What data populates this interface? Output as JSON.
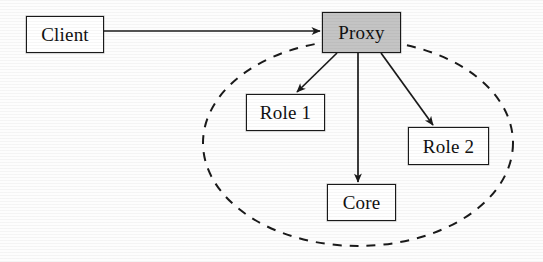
{
  "figure": {
    "type": "diagram",
    "subtype": "proxy-pattern-structure",
    "background_color": "#fdfdfd",
    "stroke_color": "#1a1a1a",
    "shaded_fill_color": "#c4c4c4"
  },
  "nodes": [
    {
      "id": "client",
      "label": "Client",
      "x": 26,
      "y": 16,
      "w": 78,
      "h": 37,
      "fill": "#ffffff",
      "shaded": false,
      "font_size": 19
    },
    {
      "id": "proxy",
      "label": "Proxy",
      "x": 322,
      "y": 12,
      "w": 79,
      "h": 41,
      "fill": "#c4c4c4",
      "shaded": true,
      "font_size": 19
    },
    {
      "id": "role1",
      "label": "Role 1",
      "x": 246,
      "y": 94,
      "w": 79,
      "h": 37,
      "fill": "#ffffff",
      "shaded": false,
      "font_size": 19
    },
    {
      "id": "role2",
      "label": "Role 2",
      "x": 408,
      "y": 127,
      "w": 81,
      "h": 38,
      "fill": "#ffffff",
      "shaded": false,
      "font_size": 19
    },
    {
      "id": "core",
      "label": "Core",
      "x": 327,
      "y": 184,
      "w": 69,
      "h": 37,
      "fill": "#ffffff",
      "shaded": false,
      "font_size": 19
    }
  ],
  "grouping": {
    "id": "subject-boundary",
    "shape": "ellipse",
    "style": "dashed",
    "label": "",
    "cx": 358,
    "cy": 143,
    "rx": 155,
    "ry": 103,
    "dash_pattern": "9 8",
    "stroke_width": 2
  },
  "edges": [
    {
      "id": "client-to-proxy",
      "from": "client",
      "to": "proxy",
      "label": "",
      "arrow": true,
      "style": "solid",
      "x1": 104,
      "y1": 31,
      "x2": 320,
      "y2": 31
    },
    {
      "id": "proxy-to-role1",
      "from": "proxy",
      "to": "role1",
      "label": "",
      "arrow": true,
      "style": "solid",
      "x1": 337,
      "y1": 53,
      "x2": 297,
      "y2": 92
    },
    {
      "id": "proxy-to-core",
      "from": "proxy",
      "to": "core",
      "label": "",
      "arrow": true,
      "style": "solid",
      "x1": 358,
      "y1": 53,
      "x2": 358,
      "y2": 182
    },
    {
      "id": "proxy-to-role2",
      "from": "proxy",
      "to": "role2",
      "label": "",
      "arrow": true,
      "style": "solid",
      "x1": 381,
      "y1": 53,
      "x2": 433,
      "y2": 125
    }
  ]
}
